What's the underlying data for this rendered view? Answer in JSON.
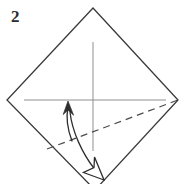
{
  "figure": {
    "kind": "origami-instruction-diagram",
    "step_number": "2",
    "width": 190,
    "height": 184,
    "background_color": "#ffffff"
  },
  "colors": {
    "paper_outline": "#3a3a3a",
    "crease_line": "#8f8f8f",
    "fold_dash_line": "#4a4a4a",
    "arrow_line": "#2e2e2e",
    "arrowhead_solid_fill": "#2e2e2e",
    "arrowhead_hollow_fill": "#ffffff",
    "arrowhead_hollow_stroke": "#2e2e2e",
    "label_text": "#2b2b2b"
  },
  "paper": {
    "shape_name": "square-rotated-45-diamond",
    "vertices": {
      "top": [
        93,
        8
      ],
      "right": [
        178,
        100
      ],
      "bottom": [
        95,
        190
      ],
      "left": [
        7,
        100
      ]
    },
    "outline_width": 1.3
  },
  "creases": [
    {
      "name": "horizontal-crease",
      "from": [
        24,
        100
      ],
      "to": [
        166,
        100
      ],
      "style": "solid",
      "width": 1.0
    },
    {
      "name": "vertical-crease",
      "from": [
        93,
        42
      ],
      "to": [
        93,
        151
      ],
      "style": "solid",
      "width": 1.0
    }
  ],
  "fold_line": {
    "name": "valley-fold-dashed-line",
    "from": [
      47,
      149
    ],
    "to": [
      178,
      100
    ],
    "style": "dashed",
    "dash_pattern": "7 5",
    "width": 1.2
  },
  "motion_arrow": {
    "name": "fold-and-unfold-arrow",
    "description": "curved double-headed arrow: solid head pointing up, hollow head pointing down-right",
    "up_stroke_path": "M 72 141 C 67 128, 66 117, 68 107",
    "up_arrowhead_points": "68 101, 63 114, 68 110, 74 115",
    "down_stroke_path": "M 70 112 C 72 131, 82 153, 95 170",
    "down_arrowhead_points": "104 180, 84 172, 94 168, 95 158",
    "stroke_width": 1.3
  },
  "labels": {
    "step": "2"
  }
}
